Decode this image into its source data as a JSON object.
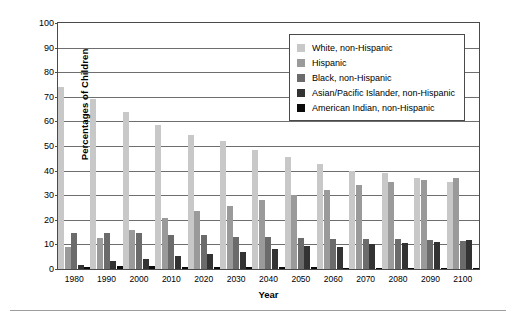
{
  "axes": {
    "ylabel": "Percentages of Children",
    "xlabel": "Year",
    "yticks": [
      "0",
      "10",
      "20",
      "30",
      "40",
      "50",
      "60",
      "70",
      "80",
      "90",
      "100"
    ]
  },
  "legend": {
    "items": [
      {
        "label": "White, non-Hispanic",
        "color": "#c8c8c8"
      },
      {
        "label": "Hispanic",
        "color": "#9a9a9a"
      },
      {
        "label": "Black, non-Hispanic",
        "color": "#6b6b6b"
      },
      {
        "label": "Asian/Pacific Islander, non-Hispanic",
        "color": "#333333"
      },
      {
        "label": "American Indian, non-Hispanic",
        "color": "#0a0a0a"
      }
    ]
  },
  "chart_data": {
    "type": "bar",
    "title": "",
    "xlabel": "Year",
    "ylabel": "Percentages of Children",
    "ylim": [
      0,
      100
    ],
    "ytick_step": 10,
    "grid": true,
    "legend_position": "top-right",
    "categories": [
      "1980",
      "1990",
      "2000",
      "2010",
      "2020",
      "2030",
      "2040",
      "2050",
      "2060",
      "2070",
      "2080",
      "2090",
      "2100"
    ],
    "series": [
      {
        "name": "White, non-Hispanic",
        "color": "#c8c8c8",
        "values": [
          74.0,
          69.0,
          64.0,
          58.5,
          54.5,
          52.0,
          48.5,
          45.5,
          42.5,
          40.0,
          39.0,
          37.0,
          35.5
        ]
      },
      {
        "name": "Hispanic",
        "color": "#9a9a9a",
        "values": [
          9.0,
          12.5,
          16.0,
          20.8,
          23.5,
          25.8,
          28.2,
          30.2,
          32.3,
          34.0,
          35.3,
          36.2,
          37.2
        ]
      },
      {
        "name": "Black, non-Hispanic",
        "color": "#6b6b6b",
        "values": [
          14.7,
          14.8,
          14.6,
          14.0,
          13.8,
          13.2,
          13.0,
          12.8,
          12.4,
          12.0,
          12.2,
          11.6,
          11.4
        ]
      },
      {
        "name": "Asian/Pacific Islander, non-Hispanic",
        "color": "#333333",
        "values": [
          1.6,
          3.2,
          3.9,
          5.2,
          6.0,
          7.0,
          8.0,
          9.5,
          9.0,
          10.0,
          10.4,
          11.0,
          11.6
        ]
      },
      {
        "name": "American Indian, non-Hispanic",
        "color": "#0a0a0a",
        "values": [
          0.8,
          1.2,
          1.2,
          0.9,
          0.8,
          0.7,
          0.7,
          0.7,
          0.6,
          0.6,
          0.5,
          0.5,
          0.5
        ]
      }
    ]
  }
}
